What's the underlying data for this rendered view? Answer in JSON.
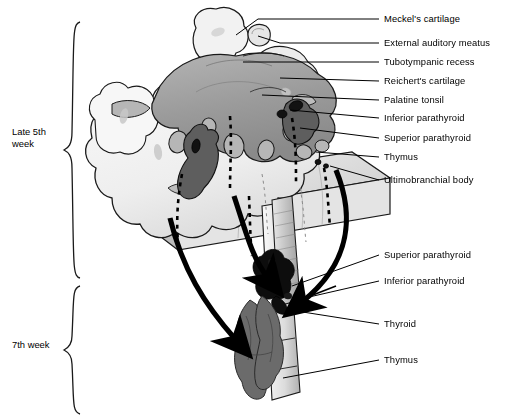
{
  "figure": {
    "background": "#ffffff",
    "ink": "#000000"
  },
  "stages": [
    {
      "id": "late-5th-week",
      "label_line1": "Late 5th",
      "label_line2": "week",
      "brace_top": 22,
      "brace_bottom": 278,
      "text_x": 12,
      "text_y": 126
    },
    {
      "id": "7th-week",
      "label_line1": "7th week",
      "label_line2": "",
      "brace_top": 286,
      "brace_bottom": 414,
      "text_x": 12,
      "text_y": 339
    }
  ],
  "labels_upper": [
    {
      "id": "meckels-cartilage",
      "text": "Meckel's cartilage",
      "x": 384,
      "y": 19,
      "tick_x1": 371,
      "tick_x2": 379,
      "lead_to_x": 258,
      "lead_to_y": 19
    },
    {
      "id": "external-auditory-meatus",
      "text": "External auditory meatus",
      "x": 384,
      "y": 43,
      "tick_x1": 371,
      "tick_x2": 379,
      "lead_to_x": 268,
      "lead_to_y": 46
    },
    {
      "id": "tubotympanic-recess",
      "text": "Tubotympanic recess",
      "x": 384,
      "y": 62,
      "tick_x1": 371,
      "tick_x2": 379,
      "lead_to_x": 243,
      "lead_to_y": 62
    },
    {
      "id": "reicherts-cartilage",
      "text": "Reichert's cartilage",
      "x": 384,
      "y": 81,
      "tick_x1": 371,
      "tick_x2": 379,
      "lead_to_x": 278,
      "lead_to_y": 78
    },
    {
      "id": "palatine-tonsil",
      "text": "Palatine tonsil",
      "x": 384,
      "y": 100,
      "tick_x1": 371,
      "tick_x2": 379,
      "lead_to_x": 262,
      "lead_to_y": 95
    },
    {
      "id": "inferior-parathyroid-1",
      "text": "Inferior parathyroid",
      "x": 384,
      "y": 118,
      "tick_x1": 371,
      "tick_x2": 379,
      "lead_to_x": 288,
      "lead_to_y": 112
    },
    {
      "id": "superior-parathyroid-1",
      "text": "Superior parathyroid",
      "x": 384,
      "y": 138,
      "tick_x1": 371,
      "tick_x2": 379,
      "lead_to_x": 300,
      "lead_to_y": 130
    },
    {
      "id": "thymus-1",
      "text": "Thymus",
      "x": 384,
      "y": 157,
      "tick_x1": 371,
      "tick_x2": 379,
      "lead_to_x": 312,
      "lead_to_y": 152
    },
    {
      "id": "ultimobranchial-body",
      "text": "Ultimobranchial body",
      "x": 384,
      "y": 180,
      "tick_x1": 371,
      "tick_x2": 379,
      "lead_to_x": 318,
      "lead_to_y": 168
    }
  ],
  "labels_lower": [
    {
      "id": "superior-parathyroid-2",
      "text": "Superior parathyroid",
      "x": 384,
      "y": 255,
      "tick_x1": 371,
      "tick_x2": 379,
      "lead_to_x": 276,
      "lead_to_y": 286
    },
    {
      "id": "inferior-parathyroid-2",
      "text": "Inferior parathyroid",
      "x": 384,
      "y": 281,
      "tick_x1": 371,
      "tick_x2": 379,
      "lead_to_x": 290,
      "lead_to_y": 300
    },
    {
      "id": "thyroid",
      "text": "Thyroid",
      "x": 384,
      "y": 324,
      "tick_x1": 371,
      "tick_x2": 379,
      "lead_to_x": 288,
      "lead_to_y": 311
    },
    {
      "id": "thymus-2",
      "text": "Thymus",
      "x": 384,
      "y": 360,
      "tick_x1": 371,
      "tick_x2": 379,
      "lead_to_x": 283,
      "lead_to_y": 378
    }
  ],
  "palette": {
    "outline": "#1a1a1a",
    "pale_tissue": "#f2f2f2",
    "light_tissue": "#e2e2e2",
    "mid_gray": "#a8a8a8",
    "tongue_gray": "#9b9b9b",
    "dark_gray": "#6e6e6e",
    "darker_gray": "#585858",
    "near_black": "#111111",
    "block_face": "#dcdcdc",
    "block_side": "#c9c9c9",
    "trachea": "#cfcfcf",
    "leader_line": "#000000"
  },
  "annotations": {
    "descent_arrows": 3,
    "dashed_descent_paths": 5,
    "arrow_style": "thick curved black arrow indicating caudal migration"
  }
}
